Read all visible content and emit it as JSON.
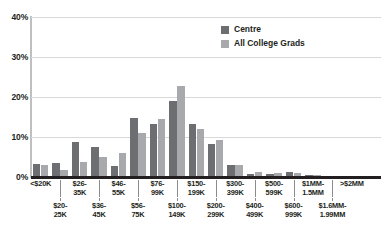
{
  "chart_data": {
    "type": "bar",
    "title": "",
    "subtitle": "",
    "xlabel": "",
    "ylabel": "",
    "ylim": [
      0,
      40
    ],
    "yticks": [
      0,
      10,
      20,
      30,
      40
    ],
    "ytick_labels": [
      "0%",
      "10%",
      "20%",
      "30%",
      "40%"
    ],
    "grid": true,
    "legend_position": "top-right",
    "categories": [
      "<$20K",
      "$20-25K",
      "$26-35K",
      "$36-45K",
      "$46-55K",
      "$56-75K",
      "$76-99K",
      "$100-149K",
      "$150-199K",
      "$200-299K",
      "$300-399K",
      "$400-499K",
      "$500-599K",
      "$600-999K",
      "$1MM-1.5MM",
      "$1.6MM-1.99MM",
      ">$2MM",
      ""
    ],
    "category_labels": [
      {
        "l1": "<$20K",
        "l2": "",
        "row": "top"
      },
      {
        "l1": "$20-",
        "l2": "25K",
        "row": "bottom"
      },
      {
        "l1": "$26-",
        "l2": "35K",
        "row": "top"
      },
      {
        "l1": "$36-",
        "l2": "45K",
        "row": "bottom"
      },
      {
        "l1": "$46-",
        "l2": "55K",
        "row": "top"
      },
      {
        "l1": "$56-",
        "l2": "75K",
        "row": "bottom"
      },
      {
        "l1": "$76-",
        "l2": "99K",
        "row": "top"
      },
      {
        "l1": "$100-",
        "l2": "149K",
        "row": "bottom"
      },
      {
        "l1": "$150-",
        "l2": "199K",
        "row": "top"
      },
      {
        "l1": "$200-",
        "l2": "299K",
        "row": "bottom"
      },
      {
        "l1": "$300-",
        "l2": "399K",
        "row": "top"
      },
      {
        "l1": "$400-",
        "l2": "499K",
        "row": "bottom"
      },
      {
        "l1": "$500-",
        "l2": "599K",
        "row": "top"
      },
      {
        "l1": "$600-",
        "l2": "999K",
        "row": "bottom"
      },
      {
        "l1": "$1MM-",
        "l2": "1.5MM",
        "row": "top"
      },
      {
        "l1": "$1.6MM-",
        "l2": "1.99MM",
        "row": "bottom"
      },
      {
        "l1": ">$2MM",
        "l2": "",
        "row": "top"
      }
    ],
    "series": [
      {
        "name": "Centre",
        "color": "#6d6e71",
        "values": [
          3.3,
          3.4,
          8.7,
          7.4,
          2.8,
          14.8,
          13.3,
          18.9,
          13.3,
          8.2,
          2.9,
          0.8,
          0.7,
          1.3,
          0.6,
          0.15,
          0.1,
          0
        ]
      },
      {
        "name": "All College Grads",
        "color": "#a7a9ac",
        "values": [
          3.1,
          1.8,
          3.8,
          5.0,
          6.0,
          11.1,
          14.5,
          22.8,
          12.1,
          9.3,
          2.9,
          1.3,
          0.9,
          0.9,
          0.4,
          0.15,
          0.2,
          0
        ]
      }
    ]
  },
  "legend": {
    "items": [
      {
        "label": "Centre",
        "color": "#6d6e71"
      },
      {
        "label": "All College Grads",
        "color": "#a7a9ac"
      }
    ]
  },
  "colors": {
    "series_centre": "#6d6e71",
    "series_all_college_grads": "#a7a9ac",
    "gridline": "#d9d9d9",
    "axis": "#231f20",
    "background": "#ffffff"
  }
}
